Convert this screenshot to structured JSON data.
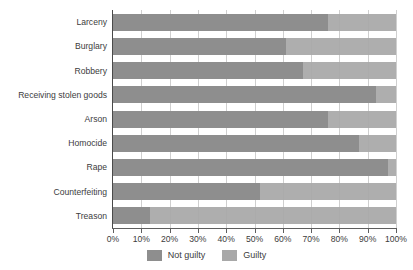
{
  "chart_data": {
    "type": "bar",
    "orientation": "horizontal",
    "stacked": true,
    "normalized_percent": true,
    "title": "",
    "subtitle": "",
    "xlabel": "",
    "ylabel": "",
    "xlim": [
      0,
      100
    ],
    "grid": true,
    "legend_position": "bottom-center",
    "categories": [
      "Larceny",
      "Burglary",
      "Robbery",
      "Receiving stolen goods",
      "Arson",
      "Homocide",
      "Rape",
      "Counterfeiting",
      "Treason"
    ],
    "series": [
      {
        "name": "Not guilty",
        "color": "#8e8e8e",
        "values": [
          76,
          61,
          67,
          93,
          76,
          87,
          97,
          52,
          13
        ]
      },
      {
        "name": "Guilty",
        "color": "#a8a8a8",
        "values": [
          24,
          39,
          33,
          7,
          24,
          13,
          3,
          48,
          87
        ]
      }
    ],
    "xticks": [
      0,
      10,
      20,
      30,
      40,
      50,
      60,
      70,
      80,
      90,
      100
    ],
    "xtick_labels": [
      "0%",
      "10%",
      "20%",
      "30%",
      "40%",
      "50%",
      "60%",
      "70%",
      "80%",
      "90%",
      "100%"
    ]
  },
  "legend": {
    "entries": [
      {
        "label": "Not guilty",
        "swatch_color": "#8e8e8e"
      },
      {
        "label": "Guilty",
        "swatch_color": "#a8a8a8"
      }
    ]
  },
  "colors": {
    "not_guilty": "#8e8e8e",
    "guilty": "#a8a8a8",
    "gridline": "#cfcfcf",
    "axis": "#5e5e5e",
    "text": "#3c3c3c",
    "background": "#ffffff"
  }
}
